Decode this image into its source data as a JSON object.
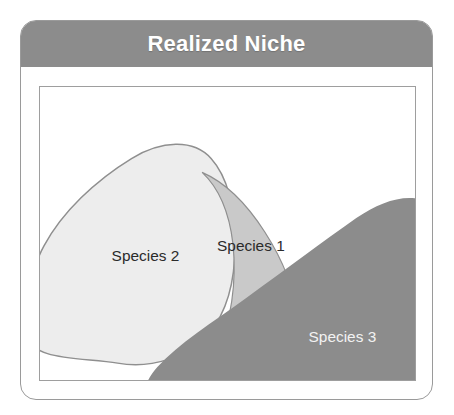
{
  "header": {
    "title": "Realized Niche"
  },
  "colors": {
    "header_bar": "#8c8c8c",
    "card_border": "#9a9a9a",
    "plot_border": "#9e9e9e",
    "species1_fill": "#c9c9c9",
    "species2_fill": "#ededed",
    "species3_fill": "#8c8c8c",
    "blob_outline": "#8f8f8f",
    "label_dark": "#2b2b2b",
    "label_light": "#f2f2f2",
    "background": "#ffffff"
  },
  "diagram": {
    "species": [
      {
        "id": "species-2",
        "label": "Species 2",
        "fill": "#ededed",
        "label_color": "dark",
        "label_x": 72,
        "label_y": 175
      },
      {
        "id": "species-1",
        "label": "Species 1",
        "fill": "#c9c9c9",
        "label_color": "dark",
        "label_x": 178,
        "label_y": 165
      },
      {
        "id": "species-3",
        "label": "Species 3",
        "fill": "#8c8c8c",
        "label_color": "light",
        "label_x": 270,
        "label_y": 257
      }
    ]
  }
}
